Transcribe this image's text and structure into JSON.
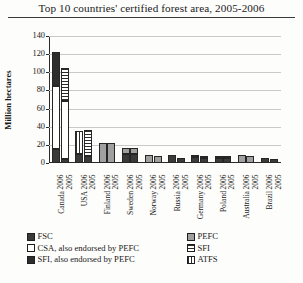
{
  "chart_data": {
    "type": "bar",
    "title": "Top 10 countries' certified forest area, 2005-2006",
    "xlabel": "",
    "ylabel": "Million hectares",
    "ylim": [
      0,
      140
    ],
    "yticks": [
      0,
      20,
      40,
      60,
      80,
      100,
      120,
      140
    ],
    "grid": true,
    "stacked": true,
    "legend_position": "bottom",
    "categories": [
      "Canada 2006",
      "Canada 2005",
      "USA 2006",
      "USA 2005",
      "Finland 2006",
      "Finland 2005",
      "Sweden 2006",
      "Sweden 2005",
      "Norway 2006",
      "Norway 2005",
      "Russia 2006",
      "Russia 2005",
      "Germany 2006",
      "Germany 2005",
      "Poland 2006",
      "Poland 2005",
      "Australia 2006",
      "Australia 2005",
      "Brazil 2006",
      "Brazil 2005"
    ],
    "countries": [
      "Canada",
      "USA",
      "Finland",
      "Sweden",
      "Norway",
      "Russia",
      "Germany",
      "Poland",
      "Australia",
      "Brazil"
    ],
    "years": [
      "2006",
      "2005"
    ],
    "series": [
      {
        "name": "FSC",
        "values": [
          16,
          4,
          10,
          8,
          0,
          0,
          10,
          10,
          0,
          0,
          9,
          5,
          7,
          6,
          5,
          5,
          0,
          0,
          5,
          4
        ]
      },
      {
        "name": "CSA, also endorsed by PEFC",
        "values": [
          69,
          64,
          0,
          0,
          0,
          0,
          0,
          0,
          0,
          0,
          0,
          0,
          0,
          0,
          0,
          0,
          0,
          0,
          0,
          0
        ]
      },
      {
        "name": "SFI, also endorsed by PEFC",
        "values": [
          37,
          0,
          0,
          0,
          0,
          0,
          0,
          0,
          0,
          0,
          0,
          0,
          0,
          0,
          0,
          0,
          0,
          0,
          0,
          0
        ]
      },
      {
        "name": "PEFC",
        "values": [
          0,
          0,
          0,
          0,
          22,
          22,
          7,
          7,
          9,
          8,
          0,
          0,
          1,
          1,
          2,
          2,
          9,
          8,
          0,
          0
        ]
      },
      {
        "name": "SFI",
        "values": [
          0,
          37,
          0,
          28,
          0,
          0,
          0,
          0,
          0,
          0,
          0,
          0,
          0,
          0,
          0,
          0,
          0,
          0,
          0,
          0
        ]
      },
      {
        "name": "ATFS",
        "values": [
          0,
          0,
          25,
          0,
          0,
          0,
          0,
          0,
          0,
          0,
          0,
          0,
          0,
          0,
          0,
          0,
          0,
          0,
          0,
          0
        ]
      }
    ],
    "totals": [
      122,
      105,
      35,
      36,
      22,
      22,
      17,
      17,
      9,
      8,
      9,
      5,
      8,
      7,
      7,
      7,
      9,
      8,
      5,
      4
    ],
    "colors": {
      "FSC": "#3a3a3a",
      "CSA, also endorsed by PEFC": "#ffffff",
      "SFI, also endorsed by PEFC": "#2e2e2e",
      "PEFC": "#a0a0a0",
      "SFI": "#ffffff",
      "ATFS": "#ffffff",
      "axis": "#2a2a2a",
      "gridline": "#c9c9c9",
      "background": "#fdfdfb"
    }
  },
  "legend": {
    "left_column": [
      {
        "label": "FSC",
        "swatch": "sw-fsc"
      },
      {
        "label": "CSA, also endorsed by PEFC",
        "swatch": "sw-csa"
      },
      {
        "label": "SFI, also endorsed by PEFC",
        "swatch": "sw-sfipefc"
      }
    ],
    "right_column": [
      {
        "label": "PEFC",
        "swatch": "sw-pefc"
      },
      {
        "label": "SFI",
        "swatch": "sw-sfi"
      },
      {
        "label": "ATFS",
        "swatch": "sw-atfs"
      }
    ]
  }
}
